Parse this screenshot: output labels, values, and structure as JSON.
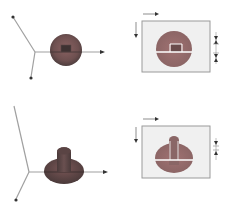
{
  "figure": {
    "colors": {
      "background": "#ffffff",
      "axis": "#9a9a9a",
      "arrowhead": "#333333",
      "object_dark": "#5e4848",
      "object_mid": "#7a5a5a",
      "object_light": "#a07878",
      "panel_fill": "#f0f0f0",
      "panel_border": "#9a9a9a",
      "cross_section_line": "#ffffff"
    },
    "rows": [
      {
        "id": "row-1",
        "left": {
          "kind": "3d-view",
          "object": "disc-with-square-center"
        },
        "right": {
          "kind": "projection-view",
          "object": "circle-with-square-center",
          "dimension_marks": 2
        }
      },
      {
        "id": "row-2",
        "left": {
          "kind": "3d-view",
          "object": "disc-with-cylinder"
        },
        "right": {
          "kind": "projection-view",
          "object": "ellipse-with-cylinder",
          "dimension_marks": 1
        }
      }
    ]
  }
}
